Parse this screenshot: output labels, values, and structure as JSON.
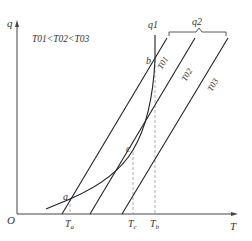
{
  "diagram": {
    "axes": {
      "y_label": "q",
      "x_label": "T",
      "origin": "O"
    },
    "condition": "T01<T02<T03",
    "lines": [
      {
        "name": "T01",
        "label": "T01"
      },
      {
        "name": "T02",
        "label": "T02"
      },
      {
        "name": "T03",
        "label": "T03"
      }
    ],
    "curve_label": "q1",
    "group_label": "q2",
    "points": {
      "a": "a",
      "b": "b",
      "c": "c"
    },
    "ticks": {
      "Ta": "T",
      "Ta_sub": "a",
      "Tc": "T",
      "Tc_sub": "c",
      "Tb": "T",
      "Tb_sub": "b"
    },
    "colors": {
      "line": "#222222",
      "dash": "#999999"
    }
  }
}
